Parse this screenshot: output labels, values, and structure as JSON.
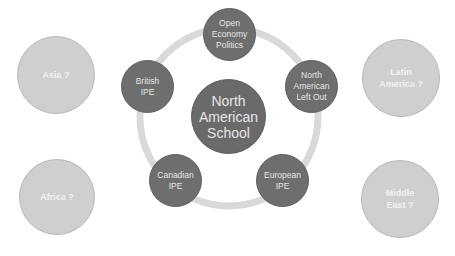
{
  "diagram": {
    "center": {
      "label": "North\nAmerican\nSchool"
    },
    "ring_nodes": [
      {
        "id": "open-economy-politics",
        "label": "Open\nEconomy\nPolitics"
      },
      {
        "id": "north-american-left-out",
        "label": "North\nAmerican\nLeft Out"
      },
      {
        "id": "european-ipe",
        "label": "European\nIPE"
      },
      {
        "id": "canadian-ipe",
        "label": "Canadian\nIPE"
      },
      {
        "id": "british-ipe",
        "label": "British\nIPE"
      }
    ],
    "outer_nodes": [
      {
        "id": "asia",
        "label": "Asia ?"
      },
      {
        "id": "africa",
        "label": "Africa ?"
      },
      {
        "id": "latin-america",
        "label": "Latin\nAmerica ?"
      },
      {
        "id": "middle-east",
        "label": "Middle\nEast ?"
      }
    ],
    "colors": {
      "dark_node": "#6e6e6e",
      "light_node": "#cfcfcf",
      "ring": "#d9d9d9",
      "text": "#e6e6e6"
    }
  }
}
